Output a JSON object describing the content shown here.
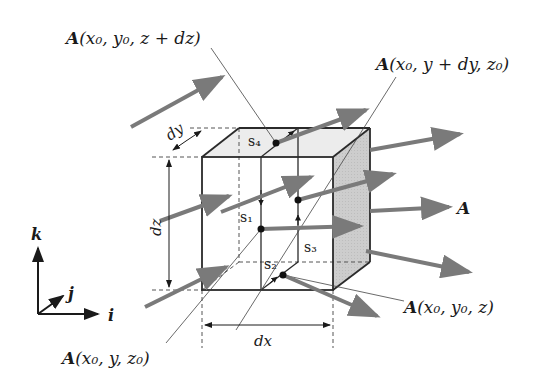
{
  "diagram": {
    "type": "vector-field-through-cube",
    "colors": {
      "edge": "#2a2a2a",
      "arrow": "#7a7a7a",
      "top_face": "#ececec",
      "side_face": "#c9c9c9",
      "guide": "#555555"
    },
    "labels": {
      "a_top": {
        "vec": "A",
        "args": "(x₀, y₀, z + dz)"
      },
      "a_right": {
        "vec": "A",
        "args": "(x₀, y + dy, z₀)"
      },
      "a_bottom_right": {
        "vec": "A",
        "args": "(x₀, y₀, z)"
      },
      "a_bottom_left": {
        "vec": "A",
        "args": "(x₀, y, z₀)"
      },
      "a_field": "A",
      "dy": "dy",
      "dz": "dz",
      "dx": "dx",
      "s1": "s₁",
      "s2": "s₂",
      "s3": "s₃",
      "s4": "s₄"
    },
    "axes": {
      "k": "k",
      "j": "j",
      "i": "i"
    }
  }
}
